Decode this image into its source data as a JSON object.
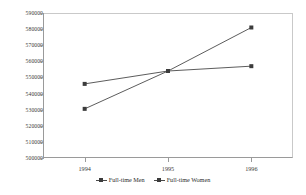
{
  "chart_data": {
    "type": "line",
    "title": "",
    "subtitle": "",
    "xlabel": "",
    "ylabel": "",
    "categories": [
      "1994",
      "1995",
      "1996"
    ],
    "x": [
      1994,
      1995,
      1996
    ],
    "ylim": [
      500000,
      590000
    ],
    "ytick_step": 10000,
    "yticks": [
      590000,
      580000,
      570000,
      560000,
      550000,
      540000,
      530000,
      520000,
      510000,
      500000
    ],
    "ytick_labels": [
      "590000",
      "580000",
      "570000",
      "560000",
      "550000",
      "540000",
      "530000",
      "520000",
      "510000",
      "500000"
    ],
    "grid": false,
    "legend_position": "bottom",
    "series": [
      {
        "name": "Full-time Men",
        "values": [
          530500,
          554000,
          581000
        ],
        "color": "#4a4a4a",
        "marker": "square"
      },
      {
        "name": "Full-time Women",
        "values": [
          546000,
          554000,
          557000
        ],
        "color": "#4a4a4a",
        "marker": "square"
      }
    ],
    "annotations": []
  },
  "legend": {
    "items": [
      {
        "label": "Full-time Men"
      },
      {
        "label": "Full-time Women"
      }
    ]
  },
  "axis_colors": {
    "axis_line": "#9a9a9a",
    "frame_line": "#c9c9c9",
    "tick_text": "#3a3a3a",
    "series_line": "#4a4a4a",
    "marker_fill": "#3c3c3c"
  }
}
